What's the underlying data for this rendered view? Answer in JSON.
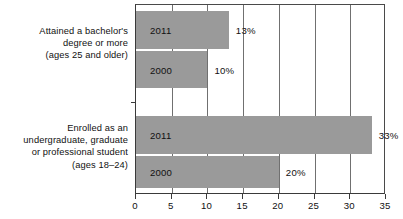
{
  "chart_data": {
    "type": "bar",
    "orientation": "horizontal",
    "title": "",
    "subtitle": "",
    "xlabel": "",
    "ylabel": "",
    "xlim": [
      0,
      35
    ],
    "xticks": [
      0,
      5,
      10,
      15,
      20,
      25,
      30,
      35
    ],
    "xtick_labels": [
      "0",
      "5",
      "10",
      "15",
      "20",
      "25",
      "30",
      "35"
    ],
    "grid": true,
    "grid_axis": "x",
    "legend": "none",
    "bar_color": "#9a9a9a",
    "axis_color": "#3a3a3a",
    "grid_color": "#707070",
    "groups": [
      {
        "label": "Attained a bachelor's\ndegree or more\n(ages 25 and older)",
        "bars": [
          {
            "series": "2011",
            "value": 13,
            "value_label": "13%"
          },
          {
            "series": "2000",
            "value": 10,
            "value_label": "10%"
          }
        ]
      },
      {
        "label": "Enrolled as an\nundergraduate, graduate\nor professional student\n(ages 18–24)",
        "bars": [
          {
            "series": "2011",
            "value": 33,
            "value_label": "33%"
          },
          {
            "series": "2000",
            "value": 20,
            "value_label": "20%"
          }
        ]
      }
    ],
    "categories": [
      "Attained a bachelor's degree or more (ages 25 and older)",
      "Enrolled as an undergraduate, graduate or professional student (ages 18–24)"
    ],
    "series": [
      {
        "name": "2011",
        "values": [
          13,
          33
        ]
      },
      {
        "name": "2000",
        "values": [
          10,
          20
        ]
      }
    ]
  }
}
